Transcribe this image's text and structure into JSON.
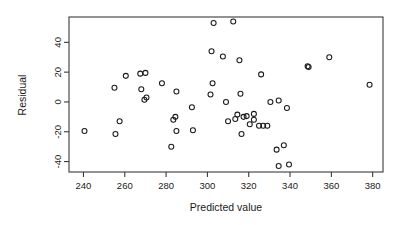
{
  "chart_data": {
    "type": "scatter",
    "title": "",
    "xlabel": "Predicted value",
    "ylabel": "Residual",
    "xlim": [
      233,
      385
    ],
    "ylim": [
      -47,
      57
    ],
    "xticks": [
      240,
      260,
      280,
      300,
      320,
      340,
      360,
      380
    ],
    "yticks": [
      -40,
      -20,
      0,
      20,
      40
    ],
    "xticklabels": [
      "240",
      "260",
      "280",
      "300",
      "320",
      "340",
      "360",
      "380"
    ],
    "yticklabels": [
      "-40",
      "-20",
      "0",
      "20",
      "40"
    ],
    "grid": false,
    "legend": null,
    "marker": "open-circle",
    "marker_color": "#1a1a1a",
    "points": [
      {
        "x": 240.5,
        "y": -19.5
      },
      {
        "x": 255.0,
        "y": 9.5
      },
      {
        "x": 255.5,
        "y": -21.5
      },
      {
        "x": 257.5,
        "y": -13.0
      },
      {
        "x": 260.5,
        "y": 17.5
      },
      {
        "x": 267.5,
        "y": 19.0
      },
      {
        "x": 268.0,
        "y": 8.5
      },
      {
        "x": 269.5,
        "y": 1.5
      },
      {
        "x": 270.0,
        "y": 19.5
      },
      {
        "x": 270.5,
        "y": 3.0
      },
      {
        "x": 278.0,
        "y": 12.5
      },
      {
        "x": 282.5,
        "y": -30.0
      },
      {
        "x": 283.5,
        "y": -12.0
      },
      {
        "x": 284.5,
        "y": -10.0
      },
      {
        "x": 285.0,
        "y": 7.0
      },
      {
        "x": 285.0,
        "y": -19.5
      },
      {
        "x": 292.5,
        "y": -3.5
      },
      {
        "x": 293.0,
        "y": -19.0
      },
      {
        "x": 301.5,
        "y": 5.0
      },
      {
        "x": 302.0,
        "y": 34.0
      },
      {
        "x": 302.5,
        "y": 12.5
      },
      {
        "x": 303.0,
        "y": 53.0
      },
      {
        "x": 307.5,
        "y": 30.5
      },
      {
        "x": 309.0,
        "y": 0.0
      },
      {
        "x": 310.0,
        "y": -13.0
      },
      {
        "x": 312.5,
        "y": 54.0
      },
      {
        "x": 313.5,
        "y": -11.5
      },
      {
        "x": 314.5,
        "y": -8.5
      },
      {
        "x": 315.5,
        "y": 28.0
      },
      {
        "x": 316.0,
        "y": 5.5
      },
      {
        "x": 316.5,
        "y": -21.5
      },
      {
        "x": 317.5,
        "y": -10.0
      },
      {
        "x": 319.0,
        "y": -9.5
      },
      {
        "x": 320.5,
        "y": -15.0
      },
      {
        "x": 322.5,
        "y": -8.0
      },
      {
        "x": 322.5,
        "y": -12.0
      },
      {
        "x": 325.0,
        "y": -16.0
      },
      {
        "x": 326.0,
        "y": 18.5
      },
      {
        "x": 327.0,
        "y": -16.0
      },
      {
        "x": 329.0,
        "y": -16.0
      },
      {
        "x": 330.5,
        "y": 0.0
      },
      {
        "x": 333.5,
        "y": -32.0
      },
      {
        "x": 334.5,
        "y": 1.0
      },
      {
        "x": 334.5,
        "y": -43.0
      },
      {
        "x": 337.0,
        "y": -29.0
      },
      {
        "x": 338.5,
        "y": -4.0
      },
      {
        "x": 339.5,
        "y": -42.0
      },
      {
        "x": 348.5,
        "y": 24.0
      },
      {
        "x": 349.0,
        "y": 23.5
      },
      {
        "x": 359.0,
        "y": 30.0
      },
      {
        "x": 378.5,
        "y": 11.5
      }
    ]
  },
  "axes": {
    "plot_left_px": 69,
    "plot_right_px": 383,
    "plot_top_px": 17,
    "plot_bottom_px": 172
  }
}
